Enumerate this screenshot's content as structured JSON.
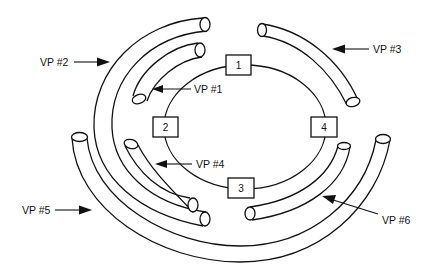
{
  "diagram": {
    "type": "ring-and-virtual-paths",
    "ring": {
      "nodes": [
        {
          "id": "1",
          "label": "1",
          "position": "top"
        },
        {
          "id": "2",
          "label": "2",
          "position": "left"
        },
        {
          "id": "3",
          "label": "3",
          "position": "bottom"
        },
        {
          "id": "4",
          "label": "4",
          "position": "right"
        }
      ]
    },
    "virtual_paths": [
      {
        "id": "vp1",
        "label": "VP #1",
        "span": "inner, upper-left arc from node 2 toward node 1"
      },
      {
        "id": "vp2",
        "label": "VP #2",
        "span": "outer, left side from top to bottom"
      },
      {
        "id": "vp3",
        "label": "VP #3",
        "span": "upper-right arc from node 1 toward node 4"
      },
      {
        "id": "vp4",
        "label": "VP #4",
        "span": "inner, lower-left arc from node 2 toward node 3"
      },
      {
        "id": "vp5",
        "label": "VP #5",
        "span": "outermost, bottom arc from left to right"
      },
      {
        "id": "vp6",
        "label": "VP #6",
        "span": "lower-right arc from node 4 toward node 3"
      }
    ],
    "colors": {
      "line": "#111111",
      "background": "#ffffff"
    }
  }
}
